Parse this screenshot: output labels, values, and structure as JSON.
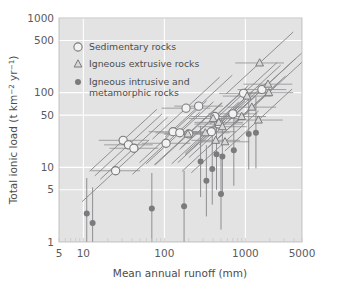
{
  "chart_data": {
    "type": "scatter",
    "title": "",
    "xlabel": "Mean annual runoff (mm)",
    "ylabel": "Total ionic load (t km−2 yr−1)",
    "ylabel_parts": {
      "pre": "Total ionic load (t km",
      "sup1": "−2",
      "mid": " yr",
      "sup2": "−1",
      "post": ")"
    },
    "xscale": "log",
    "yscale": "log",
    "xlim": [
      5,
      5000
    ],
    "ylim": [
      1,
      1000
    ],
    "xticks": [
      5,
      10,
      100,
      1000,
      5000
    ],
    "xtick_labels": [
      "5",
      "10",
      "100",
      "1000",
      "5000"
    ],
    "yticks": [
      1,
      5,
      10,
      50,
      100,
      500,
      1000
    ],
    "ytick_labels": [
      "1",
      "5",
      "10",
      "50",
      "100",
      "500",
      "1000"
    ],
    "grid": "white gridlines at decade and half-decade positions",
    "legend_position": "upper-left inside axes",
    "plot_bg": "#e3e3e3",
    "grid_color": "#ffffff",
    "marker_color": "#7b7b7d",
    "errorbar_color": "#8a8a8c",
    "legend": [
      {
        "key": "sedimentary",
        "label": "Sedimentary rocks",
        "marker": "open-circle"
      },
      {
        "key": "igneous_extrusive",
        "label": "Igneous extrusive rocks",
        "marker": "triangle"
      },
      {
        "key": "igneous_intrusive",
        "label": "Igneous intrusive and\nmetamorphic rocks",
        "marker": "filled-circle",
        "label_line1": "Igneous intrusive and",
        "label_line2": "metamorphic rocks"
      }
    ],
    "series": [
      {
        "name": "Sedimentary rocks",
        "marker": "open-circle",
        "errorbar": "diagonal",
        "points": [
          {
            "x": 25,
            "y": 9.0
          },
          {
            "x": 31,
            "y": 23.0
          },
          {
            "x": 36,
            "y": 20.0
          },
          {
            "x": 42,
            "y": 18.0
          },
          {
            "x": 105,
            "y": 21.0
          },
          {
            "x": 128,
            "y": 30.0
          },
          {
            "x": 155,
            "y": 29.0
          },
          {
            "x": 185,
            "y": 62.0
          },
          {
            "x": 200,
            "y": 28.0
          },
          {
            "x": 265,
            "y": 66.0
          },
          {
            "x": 380,
            "y": 30.0
          },
          {
            "x": 420,
            "y": 48.0
          },
          {
            "x": 470,
            "y": 38.0
          },
          {
            "x": 700,
            "y": 52.0
          },
          {
            "x": 950,
            "y": 98.0
          },
          {
            "x": 1600,
            "y": 110.0
          }
        ]
      },
      {
        "name": "Igneous extrusive rocks",
        "marker": "triangle",
        "errorbar": "diagonal",
        "points": [
          {
            "x": 195,
            "y": 28.0
          },
          {
            "x": 320,
            "y": 29.0
          },
          {
            "x": 400,
            "y": 45.0
          },
          {
            "x": 430,
            "y": 23.0
          },
          {
            "x": 470,
            "y": 40.0
          },
          {
            "x": 520,
            "y": 35.0
          },
          {
            "x": 560,
            "y": 22.0
          },
          {
            "x": 900,
            "y": 48.0
          },
          {
            "x": 1050,
            "y": 90.0
          },
          {
            "x": 1200,
            "y": 64.0
          },
          {
            "x": 1450,
            "y": 43.0
          },
          {
            "x": 1500,
            "y": 250.0
          },
          {
            "x": 1900,
            "y": 130.0
          },
          {
            "x": 1950,
            "y": 100.0
          }
        ]
      },
      {
        "name": "Igneous intrusive and metamorphic rocks",
        "marker": "filled-circle",
        "errorbar": "vertical",
        "points": [
          {
            "x": 11,
            "y": 2.4
          },
          {
            "x": 13,
            "y": 1.8
          },
          {
            "x": 70,
            "y": 2.8
          },
          {
            "x": 175,
            "y": 3.0
          },
          {
            "x": 280,
            "y": 12.0
          },
          {
            "x": 330,
            "y": 6.6
          },
          {
            "x": 390,
            "y": 9.5
          },
          {
            "x": 440,
            "y": 15.0
          },
          {
            "x": 500,
            "y": 4.4
          },
          {
            "x": 520,
            "y": 14.0
          },
          {
            "x": 720,
            "y": 17.0
          },
          {
            "x": 1100,
            "y": 28.0
          },
          {
            "x": 1350,
            "y": 29.0
          }
        ]
      }
    ]
  }
}
